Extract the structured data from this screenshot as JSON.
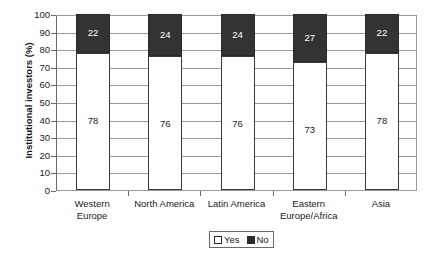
{
  "chart_data": {
    "type": "bar",
    "subtype": "stacked-100",
    "title": "",
    "xlabel": "",
    "ylabel": "Institutional investors (%)",
    "ylim": [
      0,
      100
    ],
    "ytick_step": 10,
    "yticks": [
      100,
      90,
      80,
      70,
      60,
      50,
      40,
      30,
      20,
      10,
      0
    ],
    "grid": true,
    "grid_axis": "y",
    "categories": [
      "Western Europe",
      "North America",
      "Latin America",
      "Eastern Europe/Africa",
      "Asia"
    ],
    "category_lines": [
      [
        "Western",
        "Europe"
      ],
      [
        "North America"
      ],
      [
        "Latin America"
      ],
      [
        "Eastern",
        "Europe/Africa"
      ],
      [
        "Asia"
      ]
    ],
    "series": [
      {
        "name": "Yes",
        "color": "#ffffff",
        "values": [
          78,
          76,
          76,
          73,
          78
        ]
      },
      {
        "name": "No",
        "color": "#333333",
        "values": [
          22,
          24,
          24,
          27,
          22
        ]
      }
    ],
    "legend": {
      "position": "bottom-center",
      "entries": [
        {
          "label": "Yes",
          "color": "#ffffff"
        },
        {
          "label": "No",
          "color": "#333333"
        }
      ]
    },
    "colors": {
      "yes": "#ffffff",
      "no": "#333333",
      "axis": "#6a6a6a",
      "grid": "#9a9a9a",
      "text": "#1a1a1a",
      "background": "#ffffff"
    }
  }
}
